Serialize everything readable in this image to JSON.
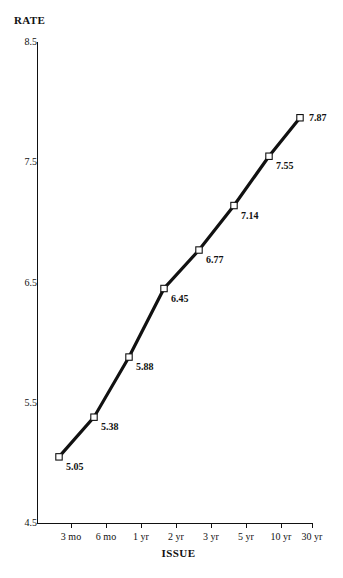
{
  "chart_data": {
    "type": "line",
    "title": "",
    "xlabel": "ISSUE",
    "ylabel": "RATE",
    "categories": [
      "3 mo",
      "6 mo",
      "1 yr",
      "2 yr",
      "3 yr",
      "5 yr",
      "10 yr",
      "30 yr"
    ],
    "values": [
      5.05,
      5.38,
      5.88,
      6.45,
      6.77,
      7.14,
      7.55,
      7.87
    ],
    "point_labels": [
      "5.05",
      "5.38",
      "5.88",
      "6.45",
      "6.77",
      "7.14",
      "7.55",
      "7.87"
    ],
    "ylim": [
      4.5,
      8.5
    ],
    "yticks": [
      8.5,
      7.5,
      6.5,
      5.5,
      4.5
    ],
    "ytick_labels": [
      "8.5",
      "7.5",
      "6.5",
      "5.5",
      "4.5"
    ],
    "grid": false,
    "legend": false,
    "legend_position": "none",
    "marker": "open-square",
    "line_color": "#111111",
    "marker_fill": "#ffffff",
    "background": "#ffffff"
  },
  "axes": {
    "y_title": "RATE",
    "x_title": "ISSUE"
  }
}
